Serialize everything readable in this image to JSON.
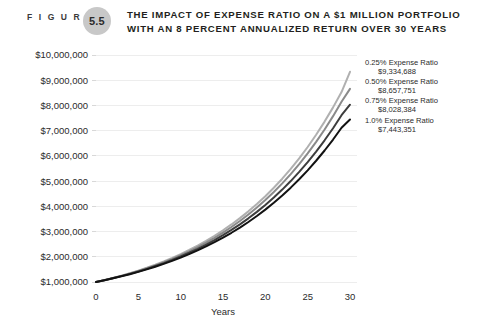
{
  "figure": {
    "label": "F I G U R E",
    "number": "5.5"
  },
  "title": {
    "line1": "THE IMPACT OF EXPENSE RATIO ON A $1 MILLION PORTFOLIO",
    "line2": "WITH AN 8 PERCENT ANNUALIZED RETURN OVER 30 YEARS"
  },
  "chart_data": {
    "type": "line",
    "title": "The Impact of Expense Ratio on a $1 Million Portfolio with an 8 Percent Annualized Return Over 30 Years",
    "xlabel": "Years",
    "ylabel": "",
    "xlim": [
      0,
      30
    ],
    "ylim": [
      1000000,
      10000000
    ],
    "grid": true,
    "legend_position": "inline-right",
    "x": [
      0,
      1,
      2,
      3,
      4,
      5,
      6,
      7,
      8,
      9,
      10,
      11,
      12,
      13,
      14,
      15,
      16,
      17,
      18,
      19,
      20,
      21,
      22,
      23,
      24,
      25,
      26,
      27,
      28,
      29,
      30
    ],
    "xticks": [
      "0",
      "5",
      "10",
      "15",
      "20",
      "25",
      "30"
    ],
    "xtick_values": [
      0,
      5,
      10,
      15,
      20,
      25,
      30
    ],
    "yticks": [
      "$1,000,000",
      "$2,000,000",
      "$3,000,000",
      "$4,000,000",
      "$5,000,000",
      "$6,000,000",
      "$7,000,000",
      "$8,000,000",
      "$9,000,000",
      "$10,000,000"
    ],
    "ytick_values": [
      1000000,
      2000000,
      3000000,
      4000000,
      5000000,
      6000000,
      7000000,
      8000000,
      9000000,
      10000000
    ],
    "series": [
      {
        "name": "0.25% Expense Ratio",
        "end_label": "$9,334,688",
        "expense_ratio": 0.25,
        "net_rate": 0.0775,
        "color": "#b0b0b0",
        "values": [
          1000000,
          1077500,
          1160981,
          1250957,
          1347906,
          1452369,
          1564908,
          1686108,
          1816582,
          1956967,
          2107932,
          2270177,
          2444516,
          2631966,
          2833433,
          3050024,
          3282651,
          3532555,
          3801178,
          4090019,
          4400996,
          4735422,
          5095492,
          5483367,
          5901326,
          6351679,
          6836934,
          7359796,
          7923180,
          8530227,
          9334688
        ]
      },
      {
        "name": "0.50% Expense Ratio",
        "end_label": "$8,657,751",
        "expense_ratio": 0.5,
        "net_rate": 0.075,
        "color": "#8a8a8a",
        "values": [
          1000000,
          1075000,
          1155625,
          1242297,
          1335469,
          1435629,
          1543302,
          1659049,
          1783478,
          1917239,
          2061032,
          2215609,
          2381780,
          2560414,
          2752445,
          2958878,
          3180794,
          3419353,
          3675804,
          3951489,
          4247850,
          4566439,
          4908922,
          5277092,
          5672874,
          6098340,
          6555716,
          7047395,
          7575949,
          8144145,
          8657751
        ]
      },
      {
        "name": "0.75% Expense Ratio",
        "end_label": "$8,028,384",
        "expense_ratio": 0.75,
        "net_rate": 0.0725,
        "color": "#3d3d3d",
        "values": [
          1000000,
          1072500,
          1150256,
          1233650,
          1323090,
          1419014,
          1521893,
          1632230,
          1750567,
          1877483,
          2013600,
          2159586,
          2316156,
          2484077,
          2664173,
          2857325,
          3064481,
          3286656,
          3524939,
          3780497,
          4054583,
          4348540,
          4663809,
          5001935,
          5364576,
          5753508,
          6170642,
          6618013,
          7097799,
          7612325,
          8028384
        ]
      },
      {
        "name": "1.0% Expense Ratio",
        "end_label": "$7,443,351",
        "expense_ratio": 1.0,
        "net_rate": 0.07,
        "color": "#121212",
        "values": [
          1000000,
          1070000,
          1144900,
          1225043,
          1310796,
          1402552,
          1500730,
          1605781,
          1718186,
          1838459,
          1967151,
          2104852,
          2252192,
          2409845,
          2578534,
          2759032,
          2952164,
          3158815,
          3379932,
          3616528,
          3869684,
          4140562,
          4430402,
          4740530,
          5072367,
          5427433,
          5807353,
          6213868,
          6648838,
          7114257,
          7443351
        ]
      }
    ]
  }
}
